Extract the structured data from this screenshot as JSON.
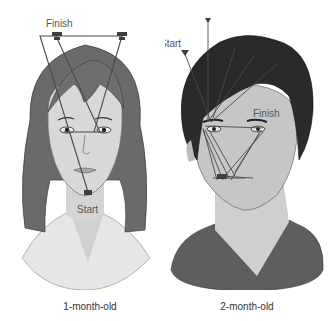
{
  "figure": {
    "panels": [
      {
        "caption": "1-month-old",
        "start_label": "Start",
        "finish_label": "Finish",
        "subject": "female-face"
      },
      {
        "caption": "2-month-old",
        "start_label": "Start",
        "finish_label": "Finish",
        "subject": "male-face"
      }
    ]
  },
  "colors": {
    "background": "#ffffff",
    "skin_light": "#d8d8d8",
    "skin_dark": "#bdbdbd",
    "hair_female": "#6a6a6a",
    "hair_male": "#2a2a2a",
    "jacket": "#5e5e5e",
    "scanpath": "#4a4a4a",
    "label_text": "#555555",
    "caption_text": "#333333"
  }
}
